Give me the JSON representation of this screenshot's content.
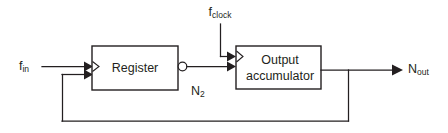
{
  "diagram": {
    "stroke_color": "#231f20",
    "background_color": "#ffffff",
    "blocks": [
      {
        "id": "register",
        "label": "Register",
        "x": 92,
        "y": 46,
        "width": 86,
        "height": 44
      },
      {
        "id": "output_accumulator",
        "label_line1": "Output",
        "label_line2": "accumulator",
        "x": 236,
        "y": 46,
        "width": 85,
        "height": 43
      }
    ],
    "signals": {
      "input": {
        "base": "f",
        "sub": "in"
      },
      "clock": {
        "base": "f",
        "sub": "clock"
      },
      "intermediate": {
        "base": "N",
        "sub": "2"
      },
      "output": {
        "base": "N",
        "sub": "out"
      }
    }
  }
}
